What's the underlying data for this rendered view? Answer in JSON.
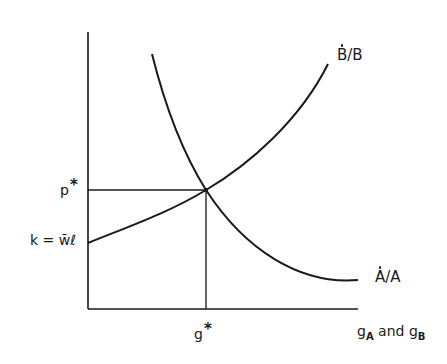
{
  "diagram": {
    "axes": {
      "y_axis": {
        "x": 88,
        "y_top": 32,
        "y_bottom": 309
      },
      "x_axis": {
        "y": 309,
        "x_left": 88,
        "x_right": 358
      },
      "x_label_main": "g",
      "x_label_sub_a": "A",
      "x_label_and": " and ",
      "x_label_sub_b": "B"
    },
    "equilibrium": {
      "point": [
        206,
        190
      ],
      "p_label": "p",
      "p_star": "*",
      "g_label": "g",
      "g_star": "*"
    },
    "curves": [
      {
        "name": "B-dot over B",
        "label_letter_1": "B",
        "label_slash": "/",
        "label_letter_2": "B",
        "direction": "upward sloping",
        "path": "M 88 243 C 130 226, 170 212, 206 190 C 250 164, 300 120, 328 64"
      },
      {
        "name": "A-dot over A",
        "label_letter_1": "A",
        "label_slash": "/",
        "label_letter_2": "A",
        "direction": "downward sloping",
        "path": "M 152 54 C 166 110, 184 155, 206 190 C 245 250, 300 285, 358 280"
      }
    ],
    "intercept_label": {
      "k": "k",
      "eq": " = ",
      "w": "w̄",
      "l": "ℓ"
    },
    "colors": {
      "ink": "#1a1a1a",
      "background": "#ffffff"
    }
  }
}
